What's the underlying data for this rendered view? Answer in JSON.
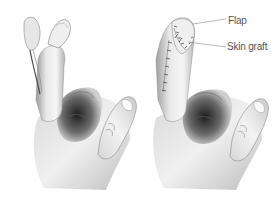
{
  "figure": {
    "panels": [
      {
        "id": "before",
        "description": "Hand with index finger raised, flap lifted from finger with pedicle"
      },
      {
        "id": "after",
        "description": "Hand with index finger raised, flap sewn over fingertip with skin graft and sutures"
      }
    ],
    "labels": {
      "flap": "Flap",
      "skin_graft": "Skin graft"
    },
    "colors": {
      "background": "#ffffff",
      "skin_light": "#f2f2f2",
      "skin_mid": "#c8c8c8",
      "skin_shadow": "#3a3a3a",
      "leader_line": "#888888",
      "label_text": "#555555"
    }
  }
}
